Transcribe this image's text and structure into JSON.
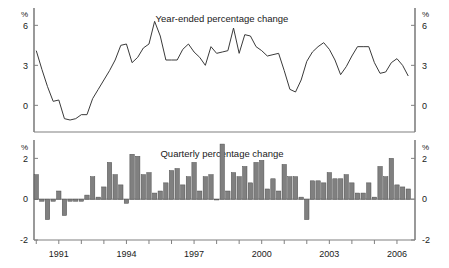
{
  "figure": {
    "background_color": "#ffffff",
    "axis_color": "#808080",
    "line_color": "#3a3a3a",
    "bar_fill_color": "#808080",
    "bar_stroke_color": "#4d4d4d",
    "text_color": "#1a1a1a"
  },
  "panels": {
    "top": {
      "title": "Year-ended percentage change",
      "unit_label_left": "%",
      "unit_label_right": "%",
      "yticks": [
        "0",
        "3",
        "6"
      ]
    },
    "bottom": {
      "title": "Quarterly percentage change",
      "unit_label_left": "%",
      "unit_label_right": "%",
      "yticks": [
        "-2",
        "0",
        "2"
      ]
    }
  },
  "xaxis": {
    "tick_labels": [
      "1991",
      "1994",
      "1997",
      "2000",
      "2003",
      "2006"
    ],
    "tick_values": [
      1991,
      1994,
      1997,
      2000,
      2003,
      2006
    ],
    "range": [
      1989.9,
      2006.8
    ]
  },
  "chart_data": [
    {
      "type": "line",
      "title": "Year-ended percentage change",
      "xlabel": "",
      "ylabel": "%",
      "ylim": [
        -2,
        7.3
      ],
      "yticks": [
        0,
        3,
        6
      ],
      "grid": false,
      "legend": "none",
      "x": [
        1990.0,
        1990.25,
        1990.5,
        1990.75,
        1991.0,
        1991.25,
        1991.5,
        1991.75,
        1992.0,
        1992.25,
        1992.5,
        1992.75,
        1993.0,
        1993.25,
        1993.5,
        1993.75,
        1994.0,
        1994.25,
        1994.5,
        1994.75,
        1995.0,
        1995.25,
        1995.5,
        1995.75,
        1996.0,
        1996.25,
        1996.5,
        1996.75,
        1997.0,
        1997.25,
        1997.5,
        1997.75,
        1998.0,
        1998.25,
        1998.5,
        1998.75,
        1999.0,
        1999.25,
        1999.5,
        1999.75,
        2000.0,
        2000.25,
        2000.5,
        2000.75,
        2001.0,
        2001.25,
        2001.5,
        2001.75,
        2002.0,
        2002.25,
        2002.5,
        2002.75,
        2003.0,
        2003.25,
        2003.5,
        2003.75,
        2004.0,
        2004.25,
        2004.5,
        2004.75,
        2005.0,
        2005.25,
        2005.5,
        2005.75,
        2006.0,
        2006.25,
        2006.5
      ],
      "y": [
        4.1,
        2.7,
        1.4,
        0.3,
        0.4,
        -1.0,
        -1.1,
        -1.0,
        -0.7,
        -0.7,
        0.5,
        1.2,
        1.9,
        2.6,
        3.4,
        4.5,
        4.6,
        3.2,
        3.6,
        4.3,
        4.6,
        6.3,
        5.2,
        3.4,
        3.4,
        3.4,
        4.2,
        4.6,
        4.0,
        3.6,
        3.0,
        4.4,
        3.9,
        4.0,
        4.1,
        5.8,
        3.9,
        5.3,
        5.2,
        4.4,
        4.1,
        3.7,
        3.8,
        3.9,
        2.6,
        1.2,
        1.0,
        1.9,
        3.3,
        4.0,
        4.4,
        4.7,
        4.2,
        3.4,
        2.3,
        2.9,
        3.7,
        4.4,
        4.4,
        4.4,
        3.2,
        2.4,
        2.5,
        3.2,
        3.5,
        3.0,
        2.2
      ]
    },
    {
      "type": "bar",
      "title": "Quarterly percentage change",
      "xlabel": "",
      "ylabel": "%",
      "ylim": [
        -2,
        2.9
      ],
      "yticks": [
        -2,
        0,
        2
      ],
      "grid": false,
      "legend": "none",
      "x": [
        1990.0,
        1990.25,
        1990.5,
        1990.75,
        1991.0,
        1991.25,
        1991.5,
        1991.75,
        1992.0,
        1992.25,
        1992.5,
        1992.75,
        1993.0,
        1993.25,
        1993.5,
        1993.75,
        1994.0,
        1994.25,
        1994.5,
        1994.75,
        1995.0,
        1995.25,
        1995.5,
        1995.75,
        1996.0,
        1996.25,
        1996.5,
        1996.75,
        1997.0,
        1997.25,
        1997.5,
        1997.75,
        1998.0,
        1998.25,
        1998.5,
        1998.75,
        1999.0,
        1999.25,
        1999.5,
        1999.75,
        2000.0,
        2000.25,
        2000.5,
        2000.75,
        2001.0,
        2001.25,
        2001.5,
        2001.75,
        2002.0,
        2002.25,
        2002.5,
        2002.75,
        2003.0,
        2003.25,
        2003.5,
        2003.75,
        2004.0,
        2004.25,
        2004.5,
        2004.75,
        2005.0,
        2005.25,
        2005.5,
        2005.75,
        2006.0,
        2006.25,
        2006.5
      ],
      "values": [
        1.2,
        -0.1,
        -1.0,
        -0.1,
        0.4,
        -0.8,
        -0.1,
        -0.1,
        -0.1,
        0.2,
        1.1,
        0.1,
        0.6,
        1.8,
        1.2,
        0.7,
        -0.2,
        2.2,
        2.1,
        1.2,
        1.3,
        0.3,
        0.4,
        0.8,
        1.4,
        1.5,
        0.7,
        1.1,
        1.8,
        0.4,
        1.1,
        1.2,
        0.0,
        2.7,
        0.4,
        1.3,
        1.1,
        1.6,
        0.8,
        1.8,
        1.9,
        0.5,
        1.0,
        0.4,
        1.7,
        1.1,
        1.1,
        0.1,
        -1.0,
        0.9,
        0.9,
        0.8,
        1.3,
        1.0,
        1.0,
        1.2,
        0.8,
        0.3,
        0.3,
        0.8,
        0.1,
        1.6,
        1.1,
        2.0,
        0.7,
        0.6,
        0.5
      ]
    }
  ]
}
